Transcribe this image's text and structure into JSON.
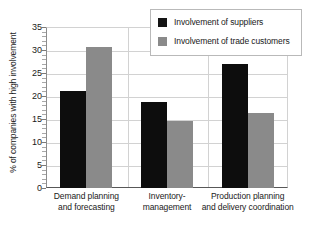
{
  "chart_data": {
    "type": "bar",
    "title": "",
    "subtitle": "",
    "xlabel": "",
    "ylabel": "% of companies with high involvement",
    "ylim": [
      0,
      35
    ],
    "ytick_step": 5,
    "yticks": [
      0,
      5,
      10,
      15,
      20,
      25,
      30,
      35
    ],
    "ytick_labels": [
      "0",
      "5",
      "10",
      "15",
      "20",
      "25",
      "30",
      "35"
    ],
    "grid": true,
    "legend_position": "top-right",
    "categories": [
      "Demand planning\nand forecasting",
      "Inventory-\nmanagement",
      "Production planning\nand delivery coordination"
    ],
    "category_lines": [
      [
        "Demand planning",
        "and forecasting"
      ],
      [
        "Inventory-",
        "management"
      ],
      [
        "Production planning",
        "and delivery coordination"
      ]
    ],
    "series": [
      {
        "name": "Involvement of suppliers",
        "color": "#0d0d0d",
        "values": [
          21.0,
          18.7,
          27.0
        ]
      },
      {
        "name": "Involvement of trade customers",
        "color": "#8a8a8a",
        "values": [
          30.7,
          14.5,
          16.2
        ]
      }
    ]
  },
  "legend": {
    "items": [
      {
        "label": "Involvement of suppliers",
        "swatch": "dark"
      },
      {
        "label": "Involvement of trade customers",
        "swatch": "gray"
      }
    ]
  },
  "axis": {
    "y_title": "% of companies with high involvement",
    "y_tick_labels": [
      "35",
      "30",
      "25",
      "20",
      "15",
      "10",
      "5",
      "0"
    ]
  },
  "colors": {
    "series_dark": "#0d0d0d",
    "series_gray": "#8a8a8a",
    "grid": "#d2d2d2",
    "axis": "#585858",
    "text": "#1a1a1a",
    "background": "#ffffff"
  }
}
